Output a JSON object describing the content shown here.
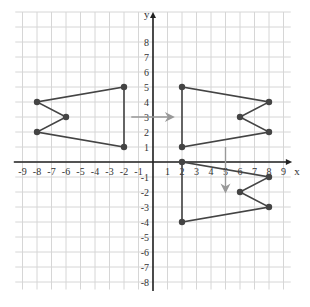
{
  "chart_data": {
    "type": "scatter",
    "title": "",
    "xlabel": "x",
    "ylabel": "y",
    "xlim": [
      -9,
      9
    ],
    "ylim": [
      -8,
      8
    ],
    "grid": true,
    "x_ticks": [
      -9,
      -8,
      -7,
      -6,
      -5,
      -4,
      -3,
      -2,
      -1,
      1,
      2,
      3,
      4,
      5,
      6,
      7,
      8,
      9
    ],
    "y_ticks": [
      -8,
      -7,
      -6,
      -5,
      -4,
      -3,
      -2,
      -1,
      1,
      2,
      3,
      4,
      5,
      6,
      7,
      8
    ],
    "series": [
      {
        "name": "original-shape",
        "closed": true,
        "points": [
          [
            -2,
            5
          ],
          [
            -2,
            1
          ],
          [
            -8,
            2
          ],
          [
            -6,
            3
          ],
          [
            -8,
            4
          ]
        ]
      },
      {
        "name": "reflected-across-y-axis",
        "closed": true,
        "points": [
          [
            2,
            5
          ],
          [
            2,
            1
          ],
          [
            8,
            2
          ],
          [
            6,
            3
          ],
          [
            8,
            4
          ]
        ]
      },
      {
        "name": "translated-down-5",
        "closed": true,
        "points": [
          [
            2,
            0
          ],
          [
            2,
            -4
          ],
          [
            8,
            -3
          ],
          [
            6,
            -2
          ],
          [
            8,
            -1
          ]
        ]
      }
    ],
    "annotations": [
      {
        "type": "arrow",
        "from": [
          -1.5,
          3
        ],
        "to": [
          1.3,
          3
        ],
        "color": "#999999"
      },
      {
        "type": "arrow",
        "from": [
          5,
          1
        ],
        "to": [
          5,
          -1.9
        ],
        "color": "#999999"
      }
    ]
  },
  "style": {
    "grid_color": "#d6d6d6",
    "axis_color": "#222222",
    "shape_color": "#444444",
    "arrow_color": "#9a9a9a"
  }
}
